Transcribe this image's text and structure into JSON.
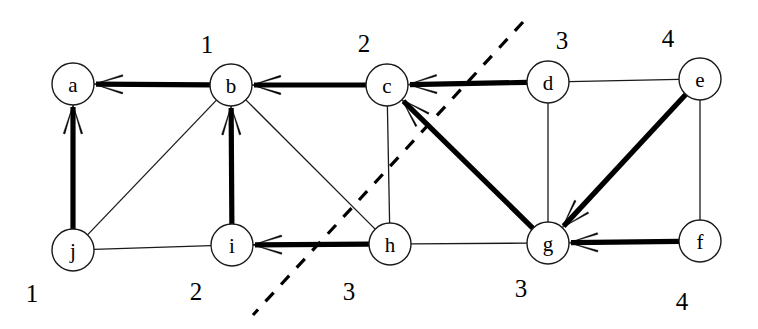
{
  "diagram": {
    "canvas": {
      "width": 758,
      "height": 329
    },
    "colors": {
      "background": "#ffffff",
      "stroke": "#1a1a1a",
      "bold_stroke": "#000000",
      "node_fill": "#ffffff",
      "dash": "#000000"
    },
    "node_radius": 21,
    "nodes": [
      {
        "id": "a",
        "label": "a",
        "x": 73,
        "y": 84
      },
      {
        "id": "b",
        "label": "b",
        "x": 231,
        "y": 85
      },
      {
        "id": "c",
        "label": "c",
        "x": 387,
        "y": 85
      },
      {
        "id": "d",
        "label": "d",
        "x": 548,
        "y": 82
      },
      {
        "id": "e",
        "label": "e",
        "x": 700,
        "y": 79
      },
      {
        "id": "f",
        "label": "f",
        "x": 700,
        "y": 241
      },
      {
        "id": "g",
        "label": "g",
        "x": 548,
        "y": 243
      },
      {
        "id": "h",
        "label": "h",
        "x": 390,
        "y": 244
      },
      {
        "id": "i",
        "label": "i",
        "x": 232,
        "y": 245
      },
      {
        "id": "j",
        "label": "j",
        "x": 73,
        "y": 250
      }
    ],
    "number_labels": [
      {
        "id": "num-b",
        "text": "1",
        "x": 207,
        "y": 44,
        "for": "b"
      },
      {
        "id": "num-c",
        "text": "2",
        "x": 364,
        "y": 43,
        "for": "c"
      },
      {
        "id": "num-d",
        "text": "3",
        "x": 562,
        "y": 40,
        "for": "d"
      },
      {
        "id": "num-e",
        "text": "4",
        "x": 668,
        "y": 38,
        "for": "e"
      },
      {
        "id": "num-j",
        "text": "1",
        "x": 32,
        "y": 293,
        "for": "j"
      },
      {
        "id": "num-i",
        "text": "2",
        "x": 196,
        "y": 291,
        "for": "i"
      },
      {
        "id": "num-h",
        "text": "3",
        "x": 349,
        "y": 291,
        "for": "h"
      },
      {
        "id": "num-g",
        "text": "3",
        "x": 521,
        "y": 288,
        "for": "g"
      },
      {
        "id": "num-f",
        "text": "4",
        "x": 682,
        "y": 301,
        "for": "f"
      }
    ],
    "thin_edges": [
      {
        "id": "edge-j-b",
        "from": "j",
        "to": "b"
      },
      {
        "id": "edge-b-h",
        "from": "b",
        "to": "h"
      },
      {
        "id": "edge-j-i",
        "from": "j",
        "to": "i"
      },
      {
        "id": "edge-i-h",
        "from": "i",
        "to": "h"
      },
      {
        "id": "edge-c-h",
        "from": "c",
        "to": "h"
      },
      {
        "id": "edge-d-e",
        "from": "d",
        "to": "e"
      },
      {
        "id": "edge-d-g",
        "from": "d",
        "to": "g"
      },
      {
        "id": "edge-e-f",
        "from": "e",
        "to": "f"
      },
      {
        "id": "edge-h-g",
        "from": "h",
        "to": "g"
      }
    ],
    "bold_arrows": [
      {
        "id": "arrow-b-a",
        "from": "b",
        "to": "a"
      },
      {
        "id": "arrow-c-b",
        "from": "c",
        "to": "b"
      },
      {
        "id": "arrow-d-c",
        "from": "d",
        "to": "c"
      },
      {
        "id": "arrow-j-a",
        "from": "j",
        "to": "a"
      },
      {
        "id": "arrow-i-b",
        "from": "i",
        "to": "b"
      },
      {
        "id": "arrow-h-i",
        "from": "h",
        "to": "i"
      },
      {
        "id": "arrow-g-c",
        "from": "g",
        "to": "c"
      },
      {
        "id": "arrow-e-g",
        "from": "e",
        "to": "g"
      },
      {
        "id": "arrow-f-g",
        "from": "f",
        "to": "g"
      }
    ],
    "cut_line": {
      "id": "dashed-cut-line",
      "x1": 523,
      "y1": 22,
      "x2": 253,
      "y2": 315
    }
  }
}
